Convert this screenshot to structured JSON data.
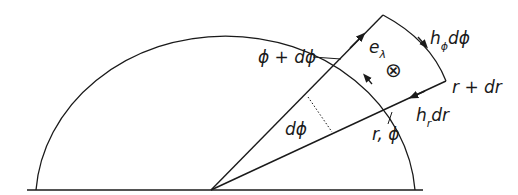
{
  "diagram": {
    "labels": {
      "phi_plus_dphi": "ϕ + dϕ",
      "e_lambda_base": "e",
      "e_lambda_sub": "λ",
      "into_page_symbol": "⊗",
      "h_phi_base": "h",
      "h_phi_sub": "ϕ",
      "h_phi_tail": "dϕ",
      "r_plus_dr": "r + dr",
      "h_r_base": "h",
      "h_r_sub": "r",
      "h_r_tail": "dr",
      "r_phi": "r, ϕ",
      "dphi": "dϕ"
    },
    "colors": {
      "stroke": "#1a1a1a",
      "background": "#ffffff"
    }
  }
}
